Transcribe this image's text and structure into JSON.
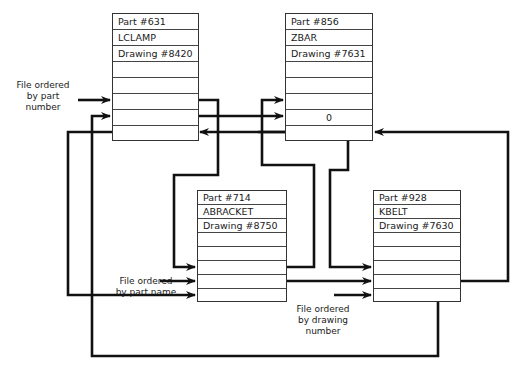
{
  "records": [
    {
      "id": "rec-631",
      "part": "Part #631",
      "name": "LCLAMP",
      "drawing": "Drawing #8420",
      "pointers": [
        "",
        "",
        ""
      ]
    },
    {
      "id": "rec-856",
      "part": "Part #856",
      "name": "ZBAR",
      "drawing": "Drawing #7631",
      "pointers": [
        "",
        "0",
        ""
      ]
    },
    {
      "id": "rec-714",
      "part": "Part #714",
      "name": "ABRACKET",
      "drawing": "Drawing #8750",
      "pointers": [
        "",
        "",
        ""
      ]
    },
    {
      "id": "rec-928",
      "part": "Part #928",
      "name": "KBELT",
      "drawing": "Drawing #7630",
      "pointers": [
        "",
        "",
        ""
      ]
    }
  ],
  "labels": {
    "by_part_number": [
      "File ordered",
      "by part",
      "number"
    ],
    "by_part_name": [
      "File ordered",
      "by part name"
    ],
    "by_drawing_number": [
      "File ordered",
      "by drawing",
      "number"
    ]
  },
  "line_color": "#111111"
}
